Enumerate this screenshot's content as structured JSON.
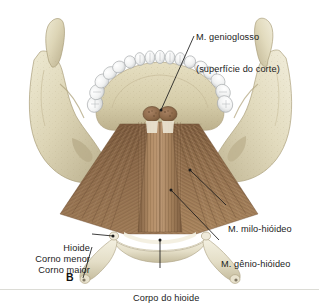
{
  "figure": {
    "letter": "B",
    "background_color": "#ffffff",
    "divider_color": "#dcdcd6"
  },
  "palette": {
    "bone_light": "#e8e2c8",
    "bone_mid": "#d8d0b0",
    "bone_shadow": "#bdb392",
    "bone_deep": "#a89d7c",
    "tooth_white": "#fbfbfb",
    "tooth_shade": "#c9cbcd",
    "tooth_line": "#9fa3a6",
    "muscle_brown": "#8a6a4a",
    "muscle_dark": "#6b4e34",
    "muscle_light": "#b9977a",
    "genio_strip": "#a07c57",
    "cut_surface": "#8d6b4e",
    "hyoid_pale": "#ebe6d2",
    "leader": "#1b1b1b",
    "text": "#1b1b1b"
  },
  "labels": [
    {
      "id": "genioglosso",
      "name": "label-genioglosso",
      "line1": "M. genioglosso",
      "line2": "(superfície do corte)",
      "align": "left",
      "x": 196,
      "y": 11
    },
    {
      "id": "milo-hioideo",
      "name": "label-milo-hioideo",
      "line1": "M. milo-hióideo",
      "line2": "",
      "align": "left",
      "x": 228,
      "y": 203
    },
    {
      "id": "genio-hioideo",
      "name": "label-genio-hioideo",
      "line1": "M. gênio-hióideo",
      "line2": "",
      "align": "left",
      "x": 221,
      "y": 238
    },
    {
      "id": "hioide",
      "name": "label-hioide",
      "line1": "Hioide",
      "line2": "",
      "align": "right",
      "x": 24,
      "y": 222
    },
    {
      "id": "corno-menor",
      "name": "label-corno-menor",
      "line1": "Corno menor",
      "line2": "",
      "align": "right",
      "x": 24,
      "y": 233
    },
    {
      "id": "corno-maior",
      "name": "label-corno-maior",
      "line1": "Corno maior",
      "line2": "",
      "align": "right",
      "x": 24,
      "y": 244
    },
    {
      "id": "corpo-do-hioide",
      "name": "label-corpo-do-hioide",
      "line1": "Corpo do hioide",
      "line2": "",
      "align": "left",
      "x": 133,
      "y": 272
    }
  ],
  "structures": [
    {
      "id": "mandible-left-ramus",
      "name": "mandible-left-ramus"
    },
    {
      "id": "mandible-right-ramus",
      "name": "mandible-right-ramus"
    },
    {
      "id": "dental-arch",
      "name": "dental-arch"
    },
    {
      "id": "mylohyoid-muscle",
      "name": "mylohyoid-muscle"
    },
    {
      "id": "geniohyoid-muscle",
      "name": "geniohyoid-muscle"
    },
    {
      "id": "genioglossus-cut",
      "name": "genioglossus-cut-surface"
    },
    {
      "id": "hyoid-body",
      "name": "hyoid-body"
    },
    {
      "id": "hyoid-greater-horn-l",
      "name": "hyoid-greater-horn-left"
    },
    {
      "id": "hyoid-greater-horn-r",
      "name": "hyoid-greater-horn-right"
    },
    {
      "id": "hyoid-lesser-horn-l",
      "name": "hyoid-lesser-horn-left"
    },
    {
      "id": "hyoid-lesser-horn-r",
      "name": "hyoid-lesser-horn-right"
    }
  ]
}
